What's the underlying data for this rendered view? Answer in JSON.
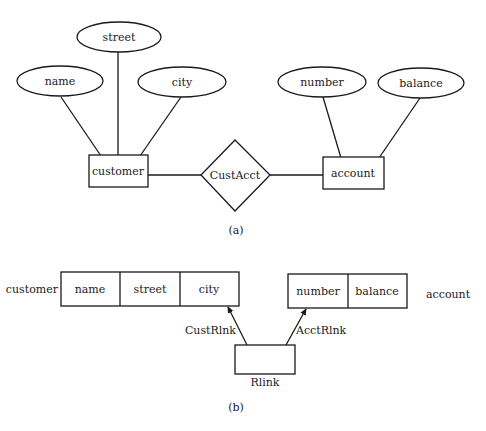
{
  "figure_a": {
    "caption": "(a)",
    "entities": [
      {
        "label": "customer"
      },
      {
        "label": "account"
      }
    ],
    "relationship": {
      "label": "CustAcct"
    },
    "attributes": {
      "customer": [
        {
          "label": "name"
        },
        {
          "label": "street"
        },
        {
          "label": "city"
        }
      ],
      "account": [
        {
          "label": "number"
        },
        {
          "label": "balance"
        }
      ]
    }
  },
  "figure_b": {
    "caption": "(b)",
    "records": [
      {
        "label": "customer",
        "fields": [
          "name",
          "street",
          "city"
        ]
      },
      {
        "label": "account",
        "fields": [
          "number",
          "balance"
        ]
      }
    ],
    "link_record": {
      "label": "Rlink"
    },
    "links": [
      {
        "label": "CustRlnk"
      },
      {
        "label": "AcctRlnk"
      }
    ]
  },
  "colors": {
    "stroke": "#1a1a1a",
    "background": "#ffffff"
  }
}
